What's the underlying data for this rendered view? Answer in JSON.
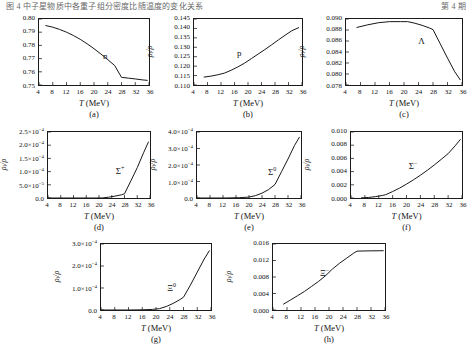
{
  "header": {
    "line": "图 4 中子星物质中各重子组分密度比随温度的变化关系",
    "right": "第 4 期"
  },
  "axis": {
    "ylabel_main": "ρ",
    "ylabel_sub": "i",
    "ylabel_tail": "/ρ",
    "xlabel_symbol": "T",
    "xlabel_unit": "(MeV)"
  },
  "chart_data": [
    {
      "id": "a",
      "type": "line",
      "caption": "(a)",
      "curve_label": "n",
      "title": "",
      "xlabel": "T (MeV)",
      "ylabel": "ρi/ρ",
      "xlim": [
        4,
        36
      ],
      "ylim": [
        0.75,
        0.8
      ],
      "xticks": [
        4,
        8,
        12,
        16,
        20,
        24,
        28,
        32,
        36
      ],
      "yticks": [
        "0.75",
        "0.76",
        "0.77",
        "0.78",
        "0.79",
        "0.80"
      ],
      "grid": false,
      "x": [
        6,
        8,
        10,
        12,
        14,
        16,
        18,
        20,
        22,
        24,
        26,
        28,
        30,
        32,
        34,
        35.5
      ],
      "values": [
        0.795,
        0.7938,
        0.7921,
        0.79,
        0.7875,
        0.7846,
        0.7812,
        0.7775,
        0.7735,
        0.7692,
        0.7648,
        0.7558,
        0.7552,
        0.7546,
        0.7539,
        0.7535
      ]
    },
    {
      "id": "b",
      "type": "line",
      "caption": "(b)",
      "curve_label": "p",
      "title": "",
      "xlabel": "T (MeV)",
      "ylabel": "ρi/ρ",
      "xlim": [
        4,
        36
      ],
      "ylim": [
        0.11,
        0.145
      ],
      "xticks": [
        4,
        8,
        12,
        16,
        20,
        24,
        28,
        32,
        36
      ],
      "yticks": [
        "0.110",
        "0.115",
        "0.120",
        "0.125",
        "0.130",
        "0.135",
        "0.140",
        "0.145"
      ],
      "grid": false,
      "x": [
        7,
        9,
        11,
        13,
        15,
        17,
        19,
        21,
        23,
        25,
        27,
        29,
        31,
        33,
        35
      ],
      "values": [
        0.1142,
        0.1147,
        0.1154,
        0.1163,
        0.1178,
        0.1196,
        0.1216,
        0.124,
        0.1264,
        0.1288,
        0.1313,
        0.1339,
        0.1364,
        0.1388,
        0.1404
      ]
    },
    {
      "id": "c",
      "type": "line",
      "caption": "(c)",
      "curve_label": "Λ",
      "title": "",
      "xlabel": "T (MeV)",
      "ylabel": "ρi/ρ",
      "xlim": [
        4,
        36
      ],
      "ylim": [
        0.078,
        0.0905
      ],
      "xticks": [
        4,
        8,
        12,
        16,
        20,
        24,
        28,
        32,
        36
      ],
      "yticks": [
        "0.078",
        "0.080",
        "0.082",
        "0.084",
        "0.086",
        "0.088",
        "0.090"
      ],
      "grid": false,
      "x": [
        7,
        10,
        13,
        16,
        19,
        21,
        23,
        25,
        27,
        28,
        30,
        32,
        34,
        35.5
      ],
      "values": [
        0.0889,
        0.0894,
        0.0898,
        0.09,
        0.09,
        0.09,
        0.0897,
        0.0893,
        0.0888,
        0.0885,
        0.0858,
        0.0831,
        0.0805,
        0.079
      ]
    },
    {
      "id": "d",
      "type": "line",
      "caption": "(d)",
      "curve_label": "Σ+",
      "title": "",
      "xlabel": "T (MeV)",
      "ylabel": "ρi/ρ",
      "xlim": [
        4,
        36
      ],
      "ylim": [
        0,
        0.00025
      ],
      "xticks": [
        4,
        8,
        12,
        16,
        20,
        24,
        28,
        32,
        36
      ],
      "yticks": [
        "0.0",
        "5.0×10-5",
        "1.0×10-4",
        "1.5×10-4",
        "2.0×10-4",
        "2.5×10-4"
      ],
      "grid": false,
      "x": [
        4,
        12,
        18,
        21,
        23,
        25,
        27,
        28,
        30,
        32,
        34,
        35.5
      ],
      "values": [
        0,
        0,
        0,
        2e-07,
        3e-06,
        7e-06,
        1.2e-05,
        1.6e-05,
        6.5e-05,
        0.000115,
        0.000172,
        0.000212
      ]
    },
    {
      "id": "e",
      "type": "line",
      "caption": "(e)",
      "curve_label": "Σ0",
      "title": "",
      "xlabel": "T (MeV)",
      "ylabel": "ρi/ρ",
      "xlim": [
        4,
        36
      ],
      "ylim": [
        0,
        0.00044
      ],
      "xticks": [
        4,
        8,
        12,
        16,
        20,
        24,
        28,
        32,
        36
      ],
      "yticks": [
        "0.0",
        "1.0×10-4",
        "2.0×10-4",
        "3.0×10-4",
        "4.0×10-4"
      ],
      "grid": false,
      "x": [
        4,
        12,
        17,
        20,
        22,
        24,
        26,
        28,
        30,
        32,
        34,
        35.5
      ],
      "values": [
        0,
        0,
        2e-06,
        6e-06,
        1.6e-05,
        3.2e-05,
        5.6e-05,
        9e-05,
        0.000175,
        0.00026,
        0.00035,
        0.000405
      ]
    },
    {
      "id": "f",
      "type": "line",
      "caption": "(f)",
      "curve_label": "Σ-",
      "title": "",
      "xlabel": "T (MeV)",
      "ylabel": "ρi/ρ",
      "xlim": [
        4,
        36
      ],
      "ylim": [
        0,
        0.01
      ],
      "xticks": [
        4,
        8,
        12,
        16,
        20,
        24,
        28,
        32,
        36
      ],
      "yticks": [
        "0.000",
        "0.002",
        "0.004",
        "0.006",
        "0.008",
        "0.010"
      ],
      "grid": false,
      "x": [
        7,
        9,
        11,
        13,
        14,
        16,
        18,
        20,
        22,
        24,
        26,
        28,
        30,
        32,
        34,
        35.5
      ],
      "values": [
        2e-05,
        8e-05,
        0.0002,
        0.00038,
        0.0005,
        0.00098,
        0.0015,
        0.0021,
        0.00275,
        0.00345,
        0.0042,
        0.005,
        0.00585,
        0.00672,
        0.0079,
        0.00885
      ]
    },
    {
      "id": "g",
      "type": "line",
      "caption": "(g)",
      "curve_label": "Ξ0",
      "title": "",
      "xlabel": "T (MeV)",
      "ylabel": "ρi/ρ",
      "xlim": [
        4,
        36
      ],
      "ylim": [
        0,
        0.00034
      ],
      "xticks": [
        4,
        8,
        12,
        16,
        20,
        24,
        28,
        32,
        36
      ],
      "yticks": [
        "0.0",
        "1.0×10-4",
        "2.0×10-4",
        "3.0×10-4"
      ],
      "grid": false,
      "x": [
        4,
        12,
        16,
        19,
        21,
        23,
        25,
        27,
        28,
        30,
        32,
        34,
        35.5
      ],
      "values": [
        0,
        0,
        1e-06,
        3e-06,
        7e-06,
        1.8e-05,
        3.4e-05,
        5.4e-05,
        6.6e-05,
        0.000128,
        0.000195,
        0.000262,
        0.000305
      ]
    },
    {
      "id": "h",
      "type": "line",
      "caption": "(h)",
      "curve_label": "Ξ-",
      "title": "",
      "xlabel": "T (MeV)",
      "ylabel": "ρi/ρ",
      "xlim": [
        4,
        36
      ],
      "ylim": [
        0,
        0.0185
      ],
      "xticks": [
        4,
        8,
        12,
        16,
        20,
        24,
        28,
        32,
        36
      ],
      "yticks": [
        "0.000",
        "0.004",
        "0.008",
        "0.012",
        "0.016"
      ],
      "grid": false,
      "x": [
        7,
        9,
        11,
        13,
        15,
        17,
        19,
        21,
        23,
        25,
        27,
        28,
        30,
        32,
        34,
        35.5
      ],
      "values": [
        0.00165,
        0.0028,
        0.004,
        0.0052,
        0.0066,
        0.008,
        0.0096,
        0.0115,
        0.0131,
        0.0145,
        0.0159,
        0.0165,
        0.01655,
        0.01658,
        0.0166,
        0.01662
      ]
    }
  ]
}
